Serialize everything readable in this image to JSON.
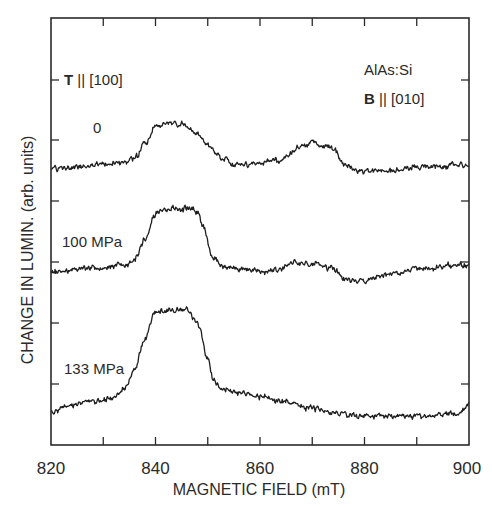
{
  "chart_data": {
    "type": "line",
    "title": "",
    "xlabel": "MAGNETIC FIELD (mT)",
    "ylabel": "CHANGE IN LUMIN. (arb. units)",
    "xlim": [
      820,
      900
    ],
    "x_ticks": [
      820,
      840,
      860,
      880,
      900
    ],
    "x_minor_ticks": [
      830,
      850,
      870,
      890
    ],
    "y_ticks_count": 6,
    "grid": false,
    "legend": "none",
    "annotations": {
      "stress_direction": {
        "bold": "T",
        "rest": " || [100]"
      },
      "sample": "AlAs:Si",
      "field_direction": {
        "bold": "B",
        "rest": " || [010]"
      }
    },
    "series": [
      {
        "name": "0",
        "label": "0",
        "offset_rank": 1,
        "x": [
          820,
          830,
          834,
          836,
          838,
          840,
          842,
          846,
          848,
          850,
          853,
          856,
          860,
          864,
          866,
          868,
          870,
          872,
          874,
          876,
          880,
          886,
          890,
          900
        ],
        "values": [
          0.0,
          0.05,
          0.1,
          0.15,
          0.4,
          0.72,
          0.78,
          0.75,
          0.6,
          0.4,
          0.15,
          0.05,
          0.08,
          0.15,
          0.25,
          0.38,
          0.45,
          0.38,
          0.35,
          0.05,
          -0.05,
          -0.05,
          0.02,
          0.05
        ]
      },
      {
        "name": "100 MPa",
        "label": "100 MPa",
        "offset_rank": 2,
        "x": [
          820,
          828,
          834,
          836,
          838,
          840,
          842,
          846,
          848,
          849,
          851,
          853,
          856,
          860,
          864,
          866,
          870,
          874,
          876,
          880,
          884,
          890,
          900
        ],
        "values": [
          0.0,
          0.05,
          0.1,
          0.2,
          0.5,
          0.9,
          0.95,
          0.95,
          0.93,
          0.7,
          0.2,
          0.1,
          0.05,
          0.0,
          0.05,
          0.15,
          0.1,
          0.05,
          -0.1,
          -0.15,
          -0.05,
          0.05,
          0.1
        ]
      },
      {
        "name": "133 MPa",
        "label": "133 MPa",
        "offset_rank": 3,
        "x": [
          820,
          823,
          828,
          832,
          834,
          836,
          838,
          840,
          846,
          848,
          850,
          851,
          853,
          856,
          860,
          864,
          866,
          870,
          874,
          880,
          890,
          898,
          900
        ],
        "values": [
          0.0,
          0.08,
          0.15,
          0.18,
          0.3,
          0.55,
          0.95,
          1.3,
          1.3,
          1.15,
          0.7,
          0.4,
          0.3,
          0.25,
          0.2,
          0.15,
          0.1,
          0.05,
          -0.02,
          -0.05,
          -0.05,
          -0.02,
          0.1
        ]
      }
    ]
  },
  "figure": {
    "plot_box_px": {
      "left": 51,
      "top": 18,
      "right": 469,
      "bottom": 445
    },
    "y_tick_px": [
      80,
      140,
      201,
      262,
      323,
      384
    ],
    "series_layout_px": [
      {
        "baseline_y": 168,
        "unit_px": 58,
        "label_x": 93,
        "label_y": 133
      },
      {
        "baseline_y": 272,
        "unit_px": 66,
        "label_x": 62,
        "label_y": 247
      },
      {
        "baseline_y": 412,
        "unit_px": 78,
        "label_x": 64,
        "label_y": 374
      }
    ],
    "noise_px": 4.2,
    "samples_per_series": 620
  }
}
